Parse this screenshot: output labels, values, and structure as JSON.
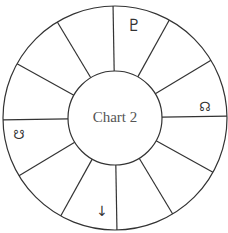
{
  "chart": {
    "title": "Chart 2",
    "center": [
      115,
      118
    ],
    "outer_radius": 112,
    "inner_radius": 47,
    "house_count": 12,
    "rotation_deg": -1,
    "line_color": "#333333",
    "text_color": "#555555"
  },
  "glyphs": [
    {
      "name": "pluto-icon",
      "symbol": "♇",
      "position": [
        134,
        26
      ],
      "size": 17
    },
    {
      "name": "north-node-icon",
      "symbol": "☊",
      "position": [
        205,
        107
      ],
      "size": 13
    },
    {
      "name": "south-node-icon",
      "symbol": "☋",
      "position": [
        19,
        135
      ],
      "size": 13
    },
    {
      "name": "down-arrow-icon",
      "symbol": "↓",
      "position": [
        102,
        212
      ],
      "size": 14
    }
  ]
}
